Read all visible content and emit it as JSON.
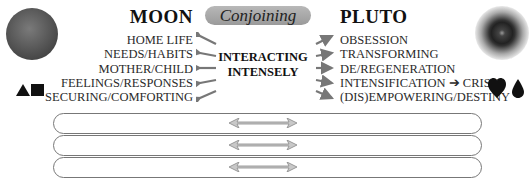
{
  "left_planet": {
    "name": "MOON",
    "icon": "moon-disc",
    "symbols": [
      "triangle",
      "square"
    ],
    "keywords": [
      "HOME LIFE",
      "NEEDS/HABITS",
      "MOTHER/CHILD",
      "FEELINGS/RESPONSES",
      "SECURING/COMFORTING"
    ]
  },
  "aspect": {
    "label": "Conjoining",
    "description_line1": "INTERACTING",
    "description_line2": "INTENSELY",
    "pill_color": "#a8a8a8"
  },
  "right_planet": {
    "name": "PLUTO",
    "icon": "pluto-ringed-disc",
    "symbols": [
      "heart",
      "drop"
    ],
    "keywords": [
      "OBSESSION",
      "TRANSFORMING",
      "DE/REGENERATION",
      "INTENSIFICATION ➔ CRISIS",
      "(DIS)EMPOWERING/DESTINY"
    ]
  },
  "bars": [
    {
      "text": "",
      "arrow": "double-arrow"
    },
    {
      "text": "",
      "arrow": "double-arrow"
    },
    {
      "text": "",
      "arrow": "double-arrow"
    }
  ]
}
